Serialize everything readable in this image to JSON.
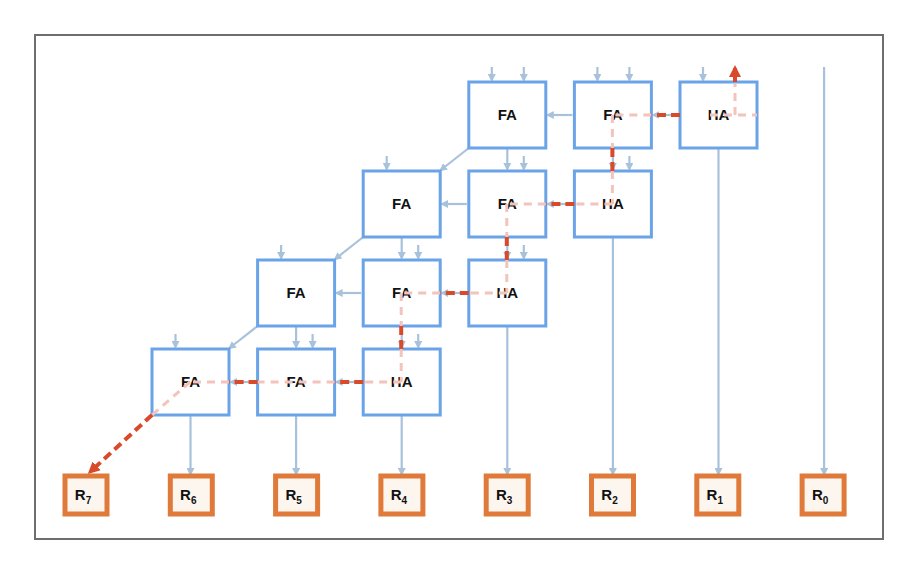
{
  "diagram": {
    "colors": {
      "frame": "#6e6e6e",
      "block_border": "#6aa3e8",
      "wire": "#a9c2db",
      "critical_path": "#d94a2b",
      "critical_path_light": "#f2c4bb",
      "output_border": "#e07a3a",
      "output_fill": "#fdf6ef"
    },
    "rows": [
      {
        "blocks": [
          {
            "col": 3,
            "label": "FA"
          },
          {
            "col": 4,
            "label": "FA"
          },
          {
            "col": 5,
            "label": "HA"
          }
        ]
      },
      {
        "blocks": [
          {
            "col": 2,
            "label": "FA"
          },
          {
            "col": 3,
            "label": "FA"
          },
          {
            "col": 4,
            "label": "HA"
          }
        ]
      },
      {
        "blocks": [
          {
            "col": 1,
            "label": "FA"
          },
          {
            "col": 2,
            "label": "FA"
          },
          {
            "col": 3,
            "label": "HA"
          }
        ]
      },
      {
        "blocks": [
          {
            "col": 0,
            "label": "FA"
          },
          {
            "col": 1,
            "label": "FA"
          },
          {
            "col": 2,
            "label": "HA"
          }
        ]
      }
    ],
    "outputs": [
      {
        "label": "R",
        "sub": "7"
      },
      {
        "label": "R",
        "sub": "6"
      },
      {
        "label": "R",
        "sub": "5"
      },
      {
        "label": "R",
        "sub": "4"
      },
      {
        "label": "R",
        "sub": "3"
      },
      {
        "label": "R",
        "sub": "2"
      },
      {
        "label": "R",
        "sub": "1"
      },
      {
        "label": "R",
        "sub": "0"
      }
    ]
  }
}
